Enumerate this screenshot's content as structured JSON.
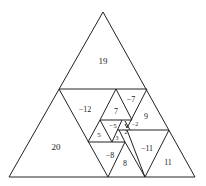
{
  "figure": {
    "labels": [
      {
        "text": "19",
        "x": 103,
        "y": 62,
        "size": 9
      },
      {
        "text": "20",
        "x": 56,
        "y": 148,
        "size": 9
      },
      {
        "text": "−12",
        "x": 85,
        "y": 110,
        "size": 8
      },
      {
        "text": "7",
        "x": 116,
        "y": 112,
        "size": 8
      },
      {
        "text": "−7",
        "x": 131,
        "y": 100,
        "size": 8
      },
      {
        "text": "9",
        "x": 146,
        "y": 117,
        "size": 8
      },
      {
        "text": "5",
        "x": 99,
        "y": 135,
        "size": 7
      },
      {
        "text": "−5",
        "x": 113,
        "y": 126,
        "size": 7
      },
      {
        "text": "−2",
        "x": 135,
        "y": 125,
        "size": 6
      },
      {
        "text": "2",
        "x": 126,
        "y": 133,
        "size": 6
      },
      {
        "text": "3",
        "x": 117,
        "y": 139,
        "size": 6
      },
      {
        "text": "−8",
        "x": 110,
        "y": 156,
        "size": 8
      },
      {
        "text": "8",
        "x": 125,
        "y": 164,
        "size": 8
      },
      {
        "text": "−11",
        "x": 147,
        "y": 149,
        "size": 8
      },
      {
        "text": "11",
        "x": 168,
        "y": 163,
        "size": 8
      }
    ]
  }
}
